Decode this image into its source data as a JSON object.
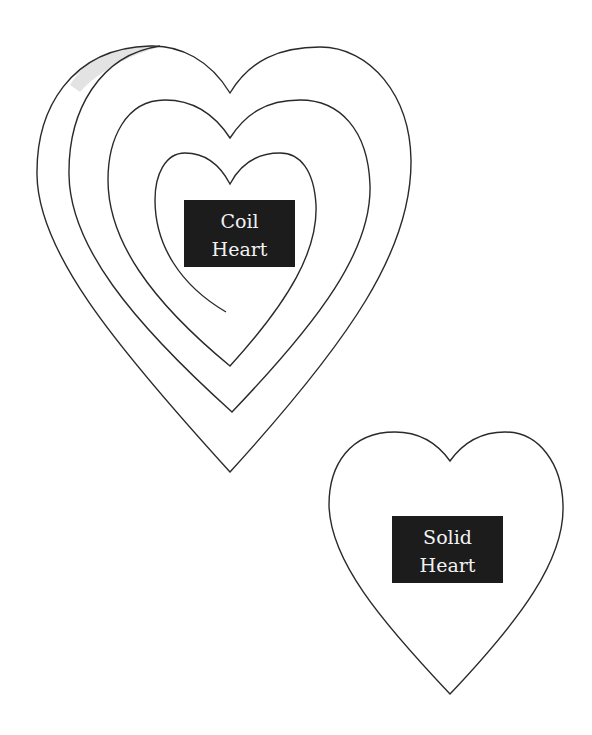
{
  "coil_heart": {
    "label_line1": "Coil",
    "label_line2": "Heart"
  },
  "solid_heart": {
    "label_line1": "Solid",
    "label_line2": "Heart"
  },
  "colors": {
    "background": "#ffffff",
    "stroke": "#2a2a2a",
    "label_bg": "#1c1c1c",
    "label_text": "#f2f2f2",
    "shade": "#e3e3e3"
  }
}
